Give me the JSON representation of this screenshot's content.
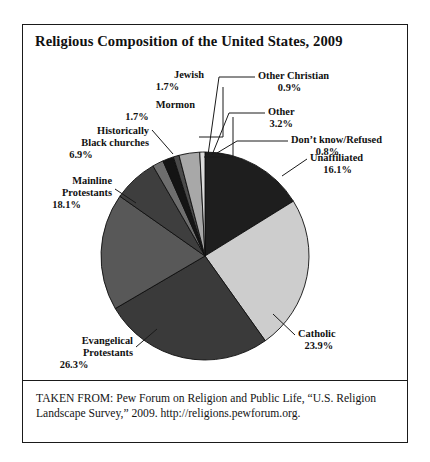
{
  "figure": {
    "title": "Religious Composition of the United States, 2009",
    "source_note": "TAKEN FROM: Pew Forum on Religion and Public Life, “U.S. Religion Landscape Survey,” 2009. http://religions.pewforum.org."
  },
  "labels": {
    "jewish": {
      "name": "Jewish",
      "pct": "1.7%"
    },
    "mormon": {
      "name": "Mormon",
      "pct": "1.7%"
    },
    "black_churches_l1": "Historically",
    "black_churches_l2": "Black churches",
    "black_churches_pct": "6.9%",
    "mainline_l1": "Mainline",
    "mainline_l2": "Protestants",
    "mainline_pct": "18.1%",
    "evangelical_l1": "Evangelical",
    "evangelical_l2": "Protestants",
    "evangelical_pct": "26.3%",
    "catholic": {
      "name": "Catholic",
      "pct": "23.9%"
    },
    "unaffiliated": {
      "name": "Unaffiliated",
      "pct": "16.1%"
    },
    "dont_know": {
      "name": "Don’t know/Refused",
      "pct": "0.8%"
    },
    "other": {
      "name": "Other",
      "pct": "3.2%"
    },
    "other_christian": {
      "name": "Other Christian",
      "pct": "0.9%"
    }
  },
  "chart_data": {
    "type": "pie",
    "title": "Religious Composition of the United States, 2009",
    "subtitle": "",
    "xlabel": "",
    "ylabel": "",
    "value_unit": "percent",
    "total": 99.6,
    "legend_position": "callout-labels",
    "grid": false,
    "start_angle_deg": 0,
    "direction": "clockwise",
    "categories": [
      "Unaffiliated",
      "Catholic",
      "Evangelical Protestants",
      "Mainline Protestants",
      "Historically Black churches",
      "Mormon",
      "Jewish",
      "Other Christian",
      "Other",
      "Don't know/Refused"
    ],
    "values": [
      16.1,
      23.9,
      26.3,
      18.1,
      6.9,
      1.7,
      1.7,
      0.9,
      3.2,
      0.8
    ],
    "colors": [
      "#1e1e1e",
      "#cdcdcd",
      "#3a3a3a",
      "#585858",
      "#3e3e3e",
      "#6e6e6e",
      "#141414",
      "#4a4a4a",
      "#a8a8a8",
      "#dcdcdc"
    ],
    "slices": [
      {
        "label": "Unaffiliated",
        "value": 16.1,
        "color": "#1e1e1e"
      },
      {
        "label": "Catholic",
        "value": 23.9,
        "color": "#cdcdcd"
      },
      {
        "label": "Evangelical Protestants",
        "value": 26.3,
        "color": "#3a3a3a"
      },
      {
        "label": "Mainline Protestants",
        "value": 18.1,
        "color": "#585858"
      },
      {
        "label": "Historically Black churches",
        "value": 6.9,
        "color": "#3e3e3e"
      },
      {
        "label": "Mormon",
        "value": 1.7,
        "color": "#6e6e6e"
      },
      {
        "label": "Jewish",
        "value": 1.7,
        "color": "#141414"
      },
      {
        "label": "Other Christian",
        "value": 0.9,
        "color": "#4a4a4a"
      },
      {
        "label": "Other",
        "value": 3.2,
        "color": "#a8a8a8"
      },
      {
        "label": "Don't know/Refused",
        "value": 0.8,
        "color": "#dcdcdc"
      }
    ]
  },
  "geometry": {
    "center_x": 182,
    "center_y": 231,
    "radius": 104
  }
}
